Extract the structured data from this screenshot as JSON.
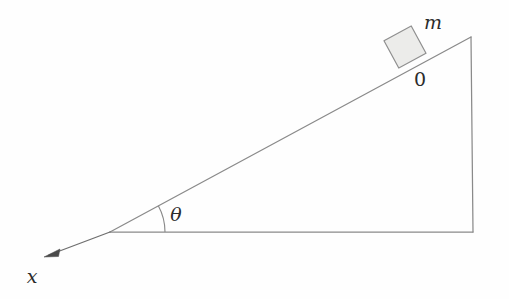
{
  "figure": {
    "background_color": "#fefefe",
    "line_color": "#8a8a8a",
    "axis_color": "#6e6e6e",
    "block_fill_color": "#ececea",
    "block_stroke_color": "#8f8f8f",
    "text_color": "#2b2b2b"
  },
  "labels": {
    "mass": "m",
    "origin": "0",
    "angle": "θ",
    "axis_x": "x"
  },
  "geometry": {
    "incline_angle_degrees": 28.5,
    "triangle": {
      "vertex_bottom_left": [
        110,
        232
      ],
      "vertex_apex": [
        471,
        37
      ],
      "vertex_bottom_right": [
        473,
        232
      ]
    },
    "angle_arc": {
      "center": [
        110,
        232
      ],
      "radius": 55,
      "start_degrees": 0,
      "end_degrees": 28.5
    },
    "x_axis_arrow": {
      "from": [
        110,
        232
      ],
      "to": [
        44,
        257
      ]
    },
    "block": {
      "center": [
        405,
        47
      ],
      "side_length": 31,
      "rotation_degrees": -28.5
    },
    "label_positions": {
      "mass": [
        433,
        29
      ],
      "origin": [
        420,
        86
      ],
      "angle": [
        176,
        214
      ],
      "axis_x": [
        32,
        277
      ]
    }
  }
}
